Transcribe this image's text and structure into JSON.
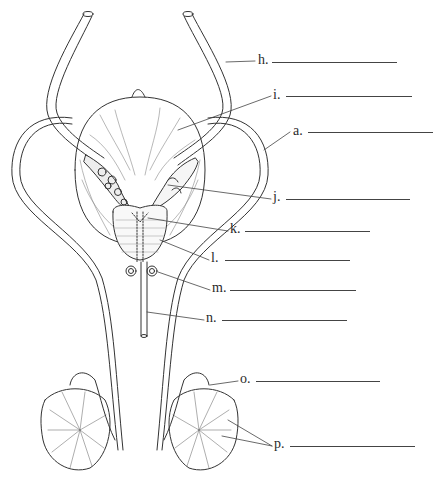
{
  "diagram": {
    "colors": {
      "ink": "#2a2a2a",
      "line": "#444444",
      "background": "#ffffff"
    },
    "labels": [
      {
        "id": "h",
        "text": "h.",
        "x": 258,
        "y": 53,
        "line_x1": 272,
        "line_x2": 397,
        "line_y": 62
      },
      {
        "id": "i",
        "text": "i.",
        "x": 273,
        "y": 88,
        "line_x1": 286,
        "line_x2": 412,
        "line_y": 96
      },
      {
        "id": "a",
        "text": "a.",
        "x": 293,
        "y": 124,
        "line_x1": 308,
        "line_x2": 433,
        "line_y": 132
      },
      {
        "id": "j",
        "text": "j.",
        "x": 273,
        "y": 190,
        "line_x1": 286,
        "line_x2": 410,
        "line_y": 199
      },
      {
        "id": "k",
        "text": "k.",
        "x": 230,
        "y": 222,
        "line_x1": 245,
        "line_x2": 370,
        "line_y": 231
      },
      {
        "id": "l",
        "text": "l.",
        "x": 211,
        "y": 251,
        "line_x1": 225,
        "line_x2": 350,
        "line_y": 260
      },
      {
        "id": "m",
        "text": "m.",
        "x": 212,
        "y": 281,
        "line_x1": 230,
        "line_x2": 356,
        "line_y": 290
      },
      {
        "id": "n",
        "text": "n.",
        "x": 206,
        "y": 311,
        "line_x1": 222,
        "line_x2": 347,
        "line_y": 320
      },
      {
        "id": "o",
        "text": "o.",
        "x": 240,
        "y": 372,
        "line_x1": 256,
        "line_x2": 380,
        "line_y": 381
      },
      {
        "id": "p",
        "text": "p.",
        "x": 274,
        "y": 437,
        "line_x1": 290,
        "line_x2": 415,
        "line_y": 446
      }
    ]
  }
}
